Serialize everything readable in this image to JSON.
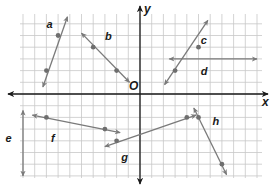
{
  "diagram": {
    "type": "coordinate-plane",
    "origin_label": "O",
    "x_axis_label": "x",
    "y_axis_label": "y",
    "colors": {
      "grid": "#c8c8c8",
      "axis": "#1a1a1a",
      "line": "#7a7a7a",
      "point": "#6e6e6e",
      "label": "#1a1a1a"
    },
    "grid": {
      "origin_px": [
        140,
        94
      ],
      "spacing_px": 11.7,
      "x_range": [
        -11,
        11
      ],
      "y_range": [
        -8,
        7
      ]
    },
    "lines": [
      {
        "name": "a",
        "points": [
          [
            -7,
            5
          ],
          [
            -8,
            2
          ]
        ],
        "label_pos": [
          -8,
          6
        ],
        "arrow_ends": [
          [
            -8.3,
            0.6
          ],
          [
            -6.2,
            6.6
          ]
        ]
      },
      {
        "name": "b",
        "points": [
          [
            -4,
            4
          ],
          [
            -2,
            2
          ]
        ],
        "label_pos": [
          -3,
          5
        ],
        "arrow_ends": [
          [
            -5,
            5.2
          ],
          [
            -0.9,
            1
          ]
        ]
      },
      {
        "name": "c",
        "points": [
          [
            5,
            4
          ],
          [
            3,
            2
          ]
        ],
        "label_pos": [
          5.2,
          4.6
        ],
        "arrow_ends": [
          [
            2.1,
            0.8
          ],
          [
            5.8,
            6.3
          ]
        ]
      },
      {
        "name": "d",
        "points": [],
        "label_pos": [
          5.2,
          2
        ],
        "arrow_ends": [
          [
            2.5,
            3
          ],
          [
            10,
            3
          ]
        ]
      },
      {
        "name": "e",
        "points": [],
        "label_pos": [
          -11.5,
          -3.8
        ],
        "arrow_ends": [
          [
            -10,
            -1.4
          ],
          [
            -10,
            -7
          ]
        ]
      },
      {
        "name": "f",
        "points": [
          [
            -8,
            -2
          ],
          [
            -3,
            -3
          ]
        ],
        "label_pos": [
          -7.6,
          -3.8
        ],
        "arrow_ends": [
          [
            -9.2,
            -1.8
          ],
          [
            -1.7,
            -3.3
          ]
        ]
      },
      {
        "name": "g",
        "points": [
          [
            -2,
            -4
          ],
          [
            4,
            -2
          ]
        ],
        "label_pos": [
          -1.6,
          -5.4
        ],
        "arrow_ends": [
          [
            -3,
            -4.5
          ],
          [
            4.8,
            -1.8
          ]
        ]
      },
      {
        "name": "h",
        "points": [
          [
            5,
            -2
          ],
          [
            7,
            -6
          ]
        ],
        "label_pos": [
          6.2,
          -2.3
        ],
        "arrow_ends": [
          [
            4.6,
            -1.2
          ],
          [
            7.4,
            -6.9
          ]
        ]
      }
    ]
  }
}
